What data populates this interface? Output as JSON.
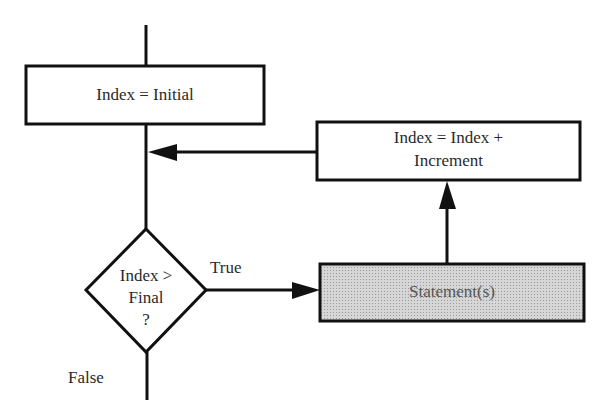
{
  "diagram": {
    "type": "flowchart",
    "title": "",
    "nodes": [
      {
        "id": "init",
        "shape": "rectangle",
        "label": "Index = Initial"
      },
      {
        "id": "decision",
        "shape": "diamond",
        "label_lines": [
          "Index >",
          "Final",
          "?"
        ]
      },
      {
        "id": "statements",
        "shape": "rectangle",
        "fill": "shaded",
        "label": "Statement(s)"
      },
      {
        "id": "increment",
        "shape": "rectangle",
        "label_lines": [
          "Index = Index +",
          "Increment"
        ]
      }
    ],
    "edges": [
      {
        "from": "start",
        "to": "init",
        "label": ""
      },
      {
        "from": "init",
        "to": "decision",
        "label": ""
      },
      {
        "from": "decision",
        "to": "statements",
        "label": "True"
      },
      {
        "from": "statements",
        "to": "increment",
        "label": ""
      },
      {
        "from": "increment",
        "to": "decision",
        "label": ""
      },
      {
        "from": "decision",
        "to": "end",
        "label": "False"
      }
    ],
    "labels": {
      "true": "True",
      "false": "False"
    },
    "colors": {
      "line": "#111111",
      "shaded_fill": "#d0d0d0",
      "background": "#ffffff"
    }
  }
}
